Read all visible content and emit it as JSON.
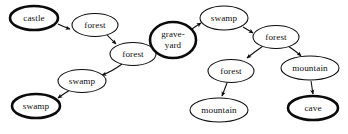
{
  "canvas": {
    "width": 348,
    "height": 134,
    "background": "#ffffff",
    "stroke_color": "#0b0b0b"
  },
  "graph": {
    "type": "directed-graph",
    "nodes": [
      {
        "id": "castle",
        "label": "castle",
        "lines": [
          "castle"
        ],
        "cx": 34,
        "cy": 18,
        "rx": 24,
        "ry": 12,
        "emphasis": "thick"
      },
      {
        "id": "forest_1",
        "label": "forest",
        "lines": [
          "forest"
        ],
        "cx": 95,
        "cy": 25,
        "rx": 23,
        "ry": 11.5,
        "emphasis": "normal"
      },
      {
        "id": "forest_2",
        "label": "forest",
        "lines": [
          "forest"
        ],
        "cx": 133,
        "cy": 54,
        "rx": 23,
        "ry": 11.5,
        "emphasis": "normal"
      },
      {
        "id": "graveyard",
        "label": "grave-yard",
        "lines": [
          "grave-",
          "yard"
        ],
        "cx": 173,
        "cy": 40,
        "rx": 23,
        "ry": 18,
        "emphasis": "thick"
      },
      {
        "id": "swamp_top",
        "label": "swamp",
        "lines": [
          "swamp"
        ],
        "cx": 224,
        "cy": 18,
        "rx": 24,
        "ry": 12,
        "emphasis": "normal"
      },
      {
        "id": "forest_3",
        "label": "forest",
        "lines": [
          "forest"
        ],
        "cx": 276,
        "cy": 37,
        "rx": 23,
        "ry": 11.5,
        "emphasis": "normal"
      },
      {
        "id": "forest_4",
        "label": "forest",
        "lines": [
          "forest"
        ],
        "cx": 231,
        "cy": 71,
        "rx": 23,
        "ry": 11.5,
        "emphasis": "normal"
      },
      {
        "id": "mountain_up",
        "label": "mountain",
        "lines": [
          "mountain"
        ],
        "cx": 310,
        "cy": 68,
        "rx": 29,
        "ry": 12,
        "emphasis": "normal"
      },
      {
        "id": "mountain_down",
        "label": "mountain",
        "lines": [
          "mountain"
        ],
        "cx": 219,
        "cy": 110,
        "rx": 29,
        "ry": 12,
        "emphasis": "normal"
      },
      {
        "id": "cave",
        "label": "cave",
        "lines": [
          "cave"
        ],
        "cx": 313,
        "cy": 108,
        "rx": 25,
        "ry": 12,
        "emphasis": "thick"
      },
      {
        "id": "swamp_mid",
        "label": "swamp",
        "lines": [
          "swamp"
        ],
        "cx": 82,
        "cy": 81,
        "rx": 24,
        "ry": 11.5,
        "emphasis": "normal"
      },
      {
        "id": "swamp_low",
        "label": "swamp",
        "lines": [
          "swamp"
        ],
        "cx": 36,
        "cy": 106,
        "rx": 24,
        "ry": 12,
        "emphasis": "thick"
      }
    ],
    "edges": [
      {
        "from": "castle",
        "to": "forest_1",
        "path": "M 58,24 C 64,27 67,28 70,29"
      },
      {
        "from": "forest_1",
        "to": "forest_2",
        "path": "M 106,34 C 111,39 113,41 116,44"
      },
      {
        "from": "forest_2",
        "to": "graveyard",
        "path": "M 152,49 C 156,47 158,46 161,45"
      },
      {
        "from": "graveyard",
        "to": "swamp_top",
        "path": "M 192,29 C 196,26 198,25 201,23"
      },
      {
        "from": "swamp_top",
        "to": "forest_3",
        "path": "M 243,27 C 248,30 250,31 253,33"
      },
      {
        "from": "forest_3",
        "to": "forest_4",
        "path": "M 263,46 C 256,51 252,54 247,58"
      },
      {
        "from": "forest_3",
        "to": "mountain_up",
        "path": "M 288,46 C 294,50 297,52 301,56"
      },
      {
        "from": "forest_4",
        "to": "mountain_down",
        "path": "M 227,83 C 225,88 224,91 222,96"
      },
      {
        "from": "mountain_up",
        "to": "cave",
        "path": "M 311,81 C 312,86 312,89 313,94"
      },
      {
        "from": "forest_2",
        "to": "swamp_mid",
        "path": "M 122,64 C 114,70 108,73 102,75"
      },
      {
        "from": "swamp_mid",
        "to": "swamp_low",
        "path": "M 70,90 C 65,93 62,95 58,98"
      }
    ]
  }
}
